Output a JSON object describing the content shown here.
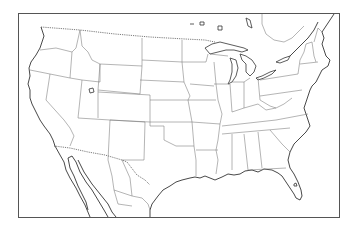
{
  "map": {
    "type": "blank outline map",
    "region": "United States (contiguous) with southern Canada and northern Mexico",
    "labels": [],
    "colors": {
      "background": "#ffffff",
      "frame": "#555555",
      "coastline": "#333333",
      "state_borders": "#777777"
    }
  }
}
